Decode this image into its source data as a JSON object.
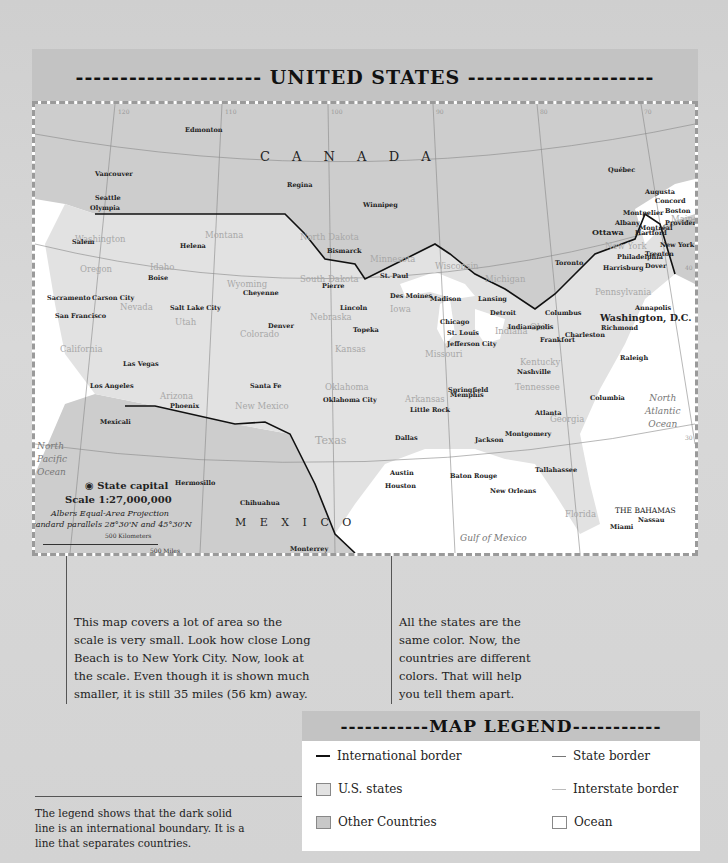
{
  "header": {
    "title": "--------------------- UNITED STATES ---------------------"
  },
  "map": {
    "colors": {
      "us_states": "#e2e2e2",
      "other_countries": "#cdcdcd",
      "ocean": "#ffffff",
      "international_border": "#111111",
      "state_border": "#9a9a9a",
      "interstate_border": "#bbbbbb"
    },
    "longitude_ticks": [
      "120",
      "110",
      "100",
      "90",
      "80",
      "70"
    ],
    "bottom_ticks": [
      "100",
      "90",
      "80"
    ],
    "latitude_ticks": [
      "40",
      "30"
    ],
    "countries": [
      {
        "name": "C A N A D A"
      },
      {
        "name": "M E X I C O"
      },
      {
        "name": "THE BAHAMAS"
      }
    ],
    "oceans": [
      {
        "name": "North\nPacific\nOcean"
      },
      {
        "name": "North\nAtlantic\nOcean"
      },
      {
        "name": "Gulf of Mexico"
      }
    ],
    "capital_label": "Washington, D.C.",
    "states": [
      "Washington",
      "Oregon",
      "California",
      "Nevada",
      "Idaho",
      "Montana",
      "Wyoming",
      "Utah",
      "Arizona",
      "Colorado",
      "New Mexico",
      "North Dakota",
      "South Dakota",
      "Nebraska",
      "Kansas",
      "Oklahoma",
      "Texas",
      "Minnesota",
      "Iowa",
      "Missouri",
      "Arkansas",
      "Louisiana",
      "Wisconsin",
      "Illinois",
      "Michigan",
      "Indiana",
      "Ohio",
      "Kentucky",
      "Tennessee",
      "Mississippi",
      "Alabama",
      "Georgia",
      "Florida",
      "North Carolina",
      "South Carolina",
      "Virginia",
      "West Virginia",
      "Pennsylvania",
      "New York",
      "Maine",
      "N.H.",
      "Vt.",
      "Mass.",
      "R.I.",
      "Conn.",
      "New Jersey",
      "Md.",
      "Del."
    ],
    "cities": [
      "Edmonton",
      "Vancouver",
      "Seattle",
      "Olympia",
      "Regina",
      "Winnipeg",
      "Québec",
      "Montréal",
      "Ottawa",
      "Toronto",
      "Salem",
      "Helena",
      "Boise",
      "Bismarck",
      "Pierre",
      "St. Paul",
      "Madison",
      "Lansing",
      "Detroit",
      "Chicago",
      "Augusta",
      "Montpelier",
      "Concord",
      "Boston",
      "Providence",
      "Albany",
      "Hartford",
      "New York",
      "Trenton",
      "Philadelphia",
      "Harrisburg",
      "Dover",
      "Annapolis",
      "Richmond",
      "Sacramento",
      "Carson City",
      "San Francisco",
      "Salt Lake City",
      "Cheyenne",
      "Denver",
      "Lincoln",
      "Des Moines",
      "Topeka",
      "Springfield",
      "Indianapolis",
      "Columbus",
      "St. Louis",
      "Jefferson City",
      "Frankfort",
      "Charleston",
      "Raleigh",
      "Nashville",
      "Las Vegas",
      "Los Angeles",
      "Santa Fe",
      "Phoenix",
      "Oklahoma City",
      "Little Rock",
      "Memphis",
      "Atlanta",
      "Columbia",
      "Jackson",
      "Montgomery",
      "Dallas",
      "Austin",
      "Houston",
      "Baton Rouge",
      "New Orleans",
      "Tallahassee",
      "Miami",
      "Mexicali",
      "Hermosillo",
      "Chihuahua",
      "Monterrey",
      "Nassau"
    ],
    "key": {
      "state_capital": "State capital",
      "scale": "Scale 1:27,000,000",
      "projection": "Albers Equal-Area Projection",
      "parallels": "Standard parallels 28°30'N and 45°30'N",
      "km_label": "500 Kilometers",
      "mi_label": "500 Miles",
      "zero": "0"
    }
  },
  "notes": {
    "scale_note": "This map covers a lot of area so the scale is very small. Look how close Long Beach is to New York City. Now, look at the scale. Even though it is shown much smaller, it is still 35 miles (56 km) away.",
    "color_note": "All the states are the same color. Now, the countries are different colors. That will help you tell them apart.",
    "legend_note": "The legend shows that the dark solid line is an international boundary. It is a line that separates countries."
  },
  "legend": {
    "title": "-----------MAP LEGEND-----------",
    "items": [
      {
        "label": "International border"
      },
      {
        "label": "State border"
      },
      {
        "label": "U.S. states"
      },
      {
        "label": "Interstate border"
      },
      {
        "label": "Other Countries"
      },
      {
        "label": "Ocean"
      }
    ]
  }
}
